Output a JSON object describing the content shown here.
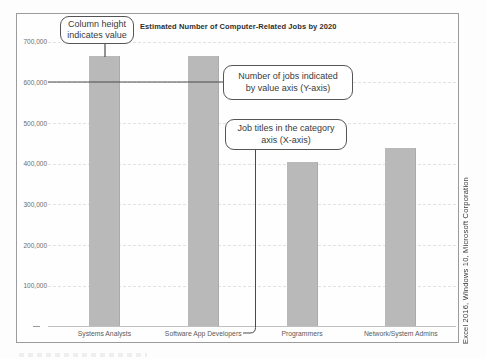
{
  "chart_data": {
    "type": "bar",
    "title": "Estimated Number of Computer-Related Jobs by 2020",
    "categories": [
      "Systems Analysts",
      "Software App Developers",
      "Programmers",
      "Network/System Admins"
    ],
    "values": [
      665000,
      665000,
      405000,
      440000
    ],
    "xlabel": "",
    "ylabel": "",
    "ylim": [
      0,
      700000
    ],
    "yticks": [
      {
        "value": 100000,
        "label": "100,000"
      },
      {
        "value": 200000,
        "label": "200,000"
      },
      {
        "value": 300000,
        "label": "300,000"
      },
      {
        "value": 400000,
        "label": "400,000"
      },
      {
        "value": 500000,
        "label": "500,000"
      },
      {
        "value": 600000,
        "label": "600,000"
      },
      {
        "value": 700000,
        "label": "700,000"
      }
    ],
    "grid": "horizontal faint dashed",
    "legend": "none",
    "bar_color": "#b9b9b9"
  },
  "annotations": {
    "callout1": {
      "lines": [
        "Column height",
        "indicates value"
      ],
      "points_to": "top of Systems Analysts column"
    },
    "callout2": {
      "lines": [
        "Number of jobs indicated",
        "by value axis (Y-axis)"
      ],
      "points_to": "600,000 value-axis label"
    },
    "callout3": {
      "lines": [
        "Job titles in the category",
        "axis (X-axis)"
      ],
      "points_to": "category axis labels"
    }
  },
  "side_caption": "Excel 2016, Windows 10, Microsoft Corporation",
  "colors": {
    "bar": "#b9b9b9",
    "gridline": "#e2e2e2",
    "frame_border": "#9b9b9b",
    "callout_border": "#555555",
    "title_text": "#2e2e2e",
    "axis_text": "#6b6b6b"
  }
}
